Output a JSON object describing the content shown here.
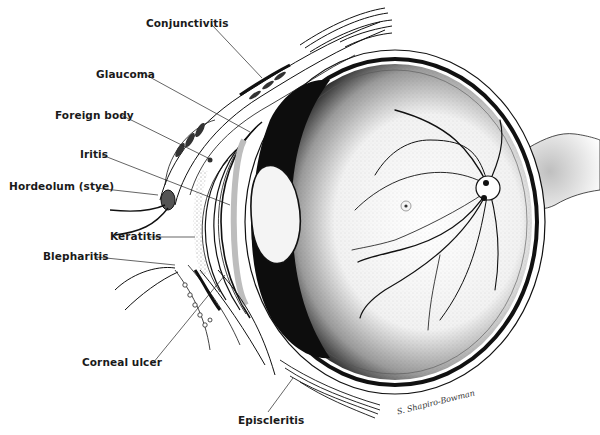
{
  "colors": {
    "ink": "#111111",
    "paper": "#ffffff",
    "label": "#1a1a1a"
  },
  "labels": [
    {
      "id": "conjunctivitis",
      "text": "Conjunctivitis"
    },
    {
      "id": "glaucoma",
      "text": "Glaucoma"
    },
    {
      "id": "foreign-body",
      "text": "Foreign body"
    },
    {
      "id": "iritis",
      "text": "Iritis"
    },
    {
      "id": "hordeolum",
      "text": "Hordeolum (stye)"
    },
    {
      "id": "keratitis",
      "text": "Keratitis"
    },
    {
      "id": "blepharitis",
      "text": "Blepharitis"
    },
    {
      "id": "corneal-ulcer",
      "text": "Corneal ulcer"
    },
    {
      "id": "episcleritis",
      "text": "Episcleritis"
    }
  ],
  "signature": "S. Shapiro-Bowman"
}
